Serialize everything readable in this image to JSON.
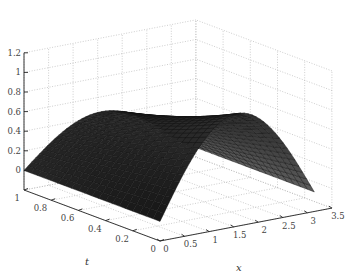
{
  "chart_data": {
    "type": "surface",
    "title": "",
    "xlabel": "x",
    "ylabel": "t",
    "zlabel": "",
    "x_range": [
      0,
      3.5
    ],
    "t_range": [
      0,
      1
    ],
    "z_range": [
      -0.2,
      1.2
    ],
    "x_ticks": [
      "0",
      "0.5",
      "1",
      "1.5",
      "2",
      "2.5",
      "3",
      "3.5"
    ],
    "t_ticks": [
      "0",
      "0.2",
      "0.4",
      "0.6",
      "0.8",
      "1"
    ],
    "z_ticks": [
      "0",
      "0.2",
      "0.4",
      "0.6",
      "0.8",
      "1",
      "1.2"
    ],
    "grid": true,
    "colormap": "gray",
    "surface": {
      "description": "u(x,t) approx = 0.95*sin(x)*exp(-0.75*t) over x in [0, pi], t in [0, 1]",
      "x_domain": [
        0,
        3.1416
      ],
      "t_domain": [
        0,
        1
      ],
      "amplitude": 0.95,
      "decay": 0.75,
      "nx": 40,
      "nt": 20,
      "sample_points": [
        {
          "x": 1.5708,
          "t": 0.0,
          "z": 0.95
        },
        {
          "x": 1.5708,
          "t": 0.5,
          "z": 0.65
        },
        {
          "x": 1.5708,
          "t": 1.0,
          "z": 0.45
        },
        {
          "x": 0.0,
          "t": 0.5,
          "z": 0.0
        },
        {
          "x": 3.1416,
          "t": 0.5,
          "z": 0.0
        }
      ]
    }
  },
  "labels": {
    "x_axis": "x",
    "t_axis": "t"
  }
}
